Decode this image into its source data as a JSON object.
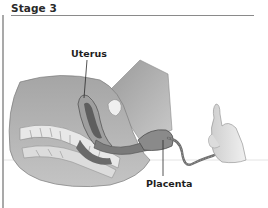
{
  "header": {
    "title": "Stage 3"
  },
  "illustration": {
    "subject": "childbirth-stage-3-cross-section",
    "palette": {
      "skin_dark": "#8c8c8c",
      "skin_mid": "#b3b3b3",
      "skin_light": "#d6d6d6",
      "outline": "#4a4a4a",
      "background": "#ffffff",
      "rule": "#8a8a8a"
    },
    "labels": [
      {
        "id": "uterus",
        "text": "Uterus"
      },
      {
        "id": "placenta",
        "text": "Placenta"
      }
    ]
  }
}
